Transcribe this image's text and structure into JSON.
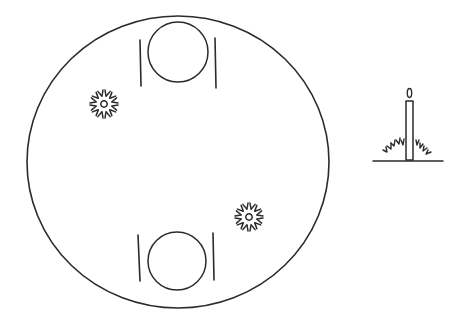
{
  "diagram": {
    "colors": {
      "ink": "#2b2b2b",
      "background": "#ffffff"
    },
    "table": {
      "shape": "circle",
      "cx": 178,
      "cy": 162,
      "rx": 151,
      "ry": 146
    },
    "place_settings": [
      {
        "name": "top-place-setting",
        "plate_cx": 178,
        "plate_cy": 52,
        "plate_r": 30,
        "left_utensil_x": 140,
        "right_utensil_x": 215
      },
      {
        "name": "bottom-place-setting",
        "plate_cx": 177,
        "plate_cy": 261,
        "plate_r": 29,
        "left_utensil_x": 139,
        "right_utensil_x": 213
      }
    ],
    "ornaments": [
      {
        "name": "sunburst-upper-left",
        "cx": 104,
        "cy": 104
      },
      {
        "name": "sunburst-lower-right",
        "cx": 249,
        "cy": 217
      }
    ],
    "candle_elevation": {
      "label": "",
      "base_line": {
        "x1": 373,
        "x2": 443,
        "y": 161
      },
      "candle": {
        "x": 406,
        "width": 7,
        "top": 101,
        "bottom": 160
      },
      "flame": {
        "cx": 410,
        "cy": 93
      }
    }
  }
}
